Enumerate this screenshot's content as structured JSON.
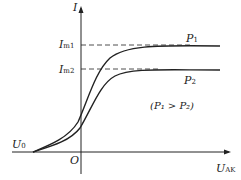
{
  "labels": {
    "y_axis": "I",
    "x_axis": "U",
    "x_axis_sub": "AK",
    "origin": "O",
    "u0": "U",
    "u0_sub": "0",
    "im1": "I",
    "im1_sub": "m1",
    "im2": "I",
    "im2_sub": "m2",
    "p1": "P",
    "p1_sub": "1",
    "p2": "P",
    "p2_sub": "2",
    "condition": "(P₁ > P₂)"
  },
  "colors": {
    "stroke": "#222222"
  }
}
